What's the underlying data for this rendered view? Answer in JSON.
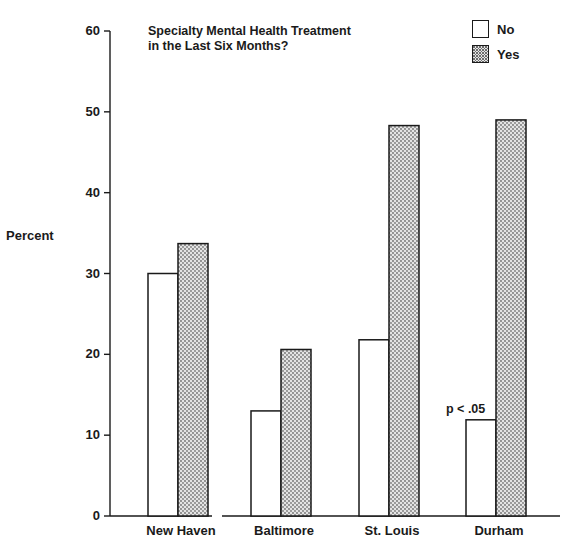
{
  "chart_data": {
    "type": "bar",
    "title": "Specialty Mental Health Treatment in the Last Six Months?",
    "title_lines": [
      "Specialty Mental Health Treatment",
      "in the Last Six Months?"
    ],
    "xlabel": "",
    "ylabel": "Percent",
    "ylim": [
      0,
      60
    ],
    "yticks": [
      0,
      10,
      20,
      30,
      40,
      50,
      60
    ],
    "grid": false,
    "legend_position": "upper right",
    "categories": [
      "New Haven",
      "Baltimore",
      "St. Louis",
      "Durham"
    ],
    "series": [
      {
        "name": "No",
        "fill": "white",
        "values": [
          30.0,
          13.0,
          21.8,
          11.9
        ]
      },
      {
        "name": "Yes",
        "fill": "stippled",
        "values": [
          33.7,
          20.6,
          48.3,
          49.0
        ]
      }
    ],
    "annotations": [
      {
        "text": "p < .05",
        "category": "Durham",
        "series": "No"
      }
    ]
  },
  "legend": {
    "items": [
      {
        "label": "No"
      },
      {
        "label": "Yes"
      }
    ]
  },
  "colors": {
    "ink": "#1a1a1a",
    "no_fill": "#ffffff",
    "yes_fill": "#d9d9d9",
    "yes_dot": "#6e6e6e"
  }
}
